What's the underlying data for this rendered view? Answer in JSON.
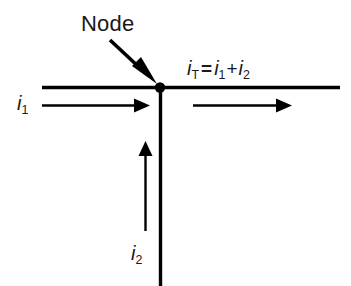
{
  "figure": {
    "type": "circuit-node-diagram",
    "background_color": "#ffffff",
    "stroke_color": "#000000",
    "text_color": "#1a1a1a"
  },
  "annotations": {
    "node_label": "Node"
  },
  "currents": {
    "incoming_left": {
      "symbol": "i",
      "subscript": "1",
      "direction": "right"
    },
    "incoming_bottom": {
      "symbol": "i",
      "subscript": "2",
      "direction": "up"
    },
    "outgoing_right": {
      "symbol": "i",
      "subscript": "T",
      "direction": "right"
    }
  },
  "equation": {
    "lhs_symbol": "i",
    "lhs_subscript": "T",
    "equals": "=",
    "term1_symbol": "i",
    "term1_subscript": "1",
    "plus": "+",
    "term2_symbol": "i",
    "term2_subscript": "2",
    "full_text": "iT = i1 + i2"
  },
  "geometry": {
    "node_x": 160,
    "node_y": 87,
    "node_radius": 5,
    "horizontal_wire": {
      "x1": 42,
      "y1": 87,
      "x2": 340,
      "y2": 87
    },
    "vertical_wire": {
      "x1": 160,
      "y1": 87,
      "x2": 160,
      "y2": 286
    },
    "arrow_left": {
      "x1": 42,
      "y1": 105,
      "x2": 148,
      "y2": 105
    },
    "arrow_right": {
      "x1": 193,
      "y1": 105,
      "x2": 291,
      "y2": 105
    },
    "arrow_up": {
      "x1": 145,
      "y1": 231,
      "x2": 145,
      "y2": 142
    },
    "pointer_arrow": {
      "x1": 110,
      "y1": 40,
      "x2": 156,
      "y2": 83
    },
    "wire_thickness": 3,
    "arrow_thickness": 2
  }
}
